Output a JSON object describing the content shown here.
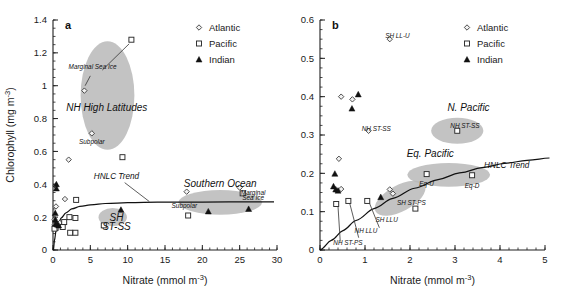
{
  "figure": {
    "panels": [
      "a",
      "b"
    ],
    "legend_entries": [
      {
        "label": "Atlantic",
        "marker": "open-diamond"
      },
      {
        "label": "Pacific",
        "marker": "open-square"
      },
      {
        "label": "Indian",
        "marker": "filled-triangle"
      }
    ],
    "blob_color": "#b8b8b8",
    "line_color": "#111111"
  },
  "chart_data": [
    {
      "type": "scatter",
      "panel": "a",
      "title": "a",
      "xlabel": "Nitrate (mmol m-3)",
      "xlabel_rich": "Nitrate (mmol m⁻³)",
      "ylabel": "Chlorophyll (mg m-3)",
      "ylabel_rich": "Chlorophyll (mg m⁻³)",
      "xlim": [
        0,
        30
      ],
      "ylim": [
        0,
        1.4
      ],
      "xticks": [
        "0",
        "5",
        "10",
        "15",
        "20",
        "25",
        "30"
      ],
      "xtick_values": [
        0,
        5,
        10,
        15,
        20,
        25,
        30
      ],
      "yticks": [
        "0",
        "0.2",
        "0.4",
        "0.6",
        "0.8",
        "1",
        "1.2",
        "1.4"
      ],
      "ytick_values": [
        0,
        0.2,
        0.4,
        0.6,
        0.8,
        1.0,
        1.2,
        1.4
      ],
      "xminor_step": 1,
      "yminor_step": 0.05,
      "grid": false,
      "legend_position": "top-right",
      "series": [
        {
          "name": "Atlantic",
          "marker": "open-diamond",
          "points": [
            [
              4.2,
              0.97
            ],
            [
              5.2,
              0.71
            ],
            [
              2.1,
              0.55
            ],
            [
              1.6,
              0.31
            ],
            [
              0.35,
              0.39
            ],
            [
              0.4,
              0.265
            ],
            [
              0.2,
              0.185
            ],
            [
              0.25,
              0.155
            ],
            [
              0.9,
              0.165
            ],
            [
              17.9,
              0.355
            ],
            [
              25.0,
              0.38
            ]
          ]
        },
        {
          "name": "Pacific",
          "marker": "open-square",
          "points": [
            [
              10.5,
              1.28
            ],
            [
              9.3,
              0.565
            ],
            [
              3.1,
              0.305
            ],
            [
              2.2,
              0.2
            ],
            [
              3.0,
              0.195
            ],
            [
              2.3,
              0.105
            ],
            [
              3.0,
              0.105
            ],
            [
              0.35,
              0.135
            ],
            [
              0.2,
              0.13
            ],
            [
              1.3,
              0.14
            ],
            [
              1.5,
              0.17
            ],
            [
              6.8,
              0.15
            ],
            [
              18.1,
              0.21
            ],
            [
              25.4,
              0.345
            ]
          ]
        },
        {
          "name": "Indian",
          "marker": "filled-triangle",
          "points": [
            [
              0.45,
              0.4
            ],
            [
              0.45,
              0.375
            ],
            [
              0.3,
              0.225
            ],
            [
              0.3,
              0.185
            ],
            [
              0.35,
              0.16
            ],
            [
              0.55,
              0.155
            ],
            [
              0.75,
              0.15
            ],
            [
              9.1,
              0.245
            ],
            [
              20.8,
              0.235
            ],
            [
              26.2,
              0.25
            ]
          ]
        }
      ],
      "trend": {
        "name": "HNLC Trend",
        "description": "saturating curve rising steeply from origin to ~0.29 plateau",
        "points": [
          [
            0.05,
            0.0
          ],
          [
            0.2,
            0.06
          ],
          [
            0.4,
            0.115
          ],
          [
            0.7,
            0.16
          ],
          [
            1.1,
            0.195
          ],
          [
            1.7,
            0.225
          ],
          [
            2.5,
            0.25
          ],
          [
            3.6,
            0.265
          ],
          [
            5,
            0.275
          ],
          [
            7,
            0.283
          ],
          [
            10,
            0.288
          ],
          [
            14,
            0.291
          ],
          [
            20,
            0.292
          ],
          [
            26,
            0.293
          ],
          [
            29.6,
            0.293
          ]
        ]
      },
      "blobs": [
        {
          "label": "NH High Latitudes",
          "cx": 7.3,
          "cy": 0.94,
          "rx": 3.6,
          "ry": 0.33,
          "label_dx": 0,
          "label_dy": -0.105
        },
        {
          "label": "SH ST-SS",
          "cx": 8.0,
          "cy": 0.2,
          "rx": 1.9,
          "ry": 0.055
        },
        {
          "label": "Southern Ocean",
          "cx": 22.4,
          "cy": 0.29,
          "rx": 5.6,
          "ry": 0.075
        }
      ],
      "annotations": [
        {
          "text": "Marginal Sea Ice",
          "x": 5.3,
          "y": 1.1,
          "style": "small-italic"
        },
        {
          "text": "NH High Latitudes",
          "x": 7.2,
          "y": 0.845,
          "style": "large-italic"
        },
        {
          "text": "Subpolar",
          "x": 5.2,
          "y": 0.645,
          "style": "small-italic"
        },
        {
          "text": "HNLC Trend",
          "x": 8.5,
          "y": 0.435,
          "style": "mid-italic"
        },
        {
          "text": "Southern Ocean",
          "x": 22.4,
          "y": 0.385,
          "style": "large-italic"
        },
        {
          "text": "Marginal",
          "x": 26.8,
          "y": 0.335,
          "style": "small-italic"
        },
        {
          "text": "Sea Ice",
          "x": 26.8,
          "y": 0.305,
          "style": "small-italic"
        },
        {
          "text": "Subpolar",
          "x": 17.6,
          "y": 0.255,
          "style": "small-italic"
        },
        {
          "text": "SH",
          "x": 8.5,
          "y": 0.175,
          "style": "large-italic"
        },
        {
          "text": "ST-SS",
          "x": 8.5,
          "y": 0.12,
          "style": "large-italic"
        }
      ]
    },
    {
      "type": "scatter",
      "panel": "b",
      "title": "b",
      "xlabel": "Nitrate (mmol m-3)",
      "xlabel_rich": "Nitrate (mmol m⁻³)",
      "ylabel": "",
      "xlim": [
        0,
        5
      ],
      "ylim": [
        0,
        0.6
      ],
      "xticks": [
        "0",
        "1",
        "2",
        "3",
        "4",
        "5"
      ],
      "xtick_values": [
        0,
        1,
        2,
        3,
        4,
        5
      ],
      "yticks": [
        "0",
        "0.1",
        "0.2",
        "0.3",
        "0.4",
        "0.5",
        "0.6"
      ],
      "ytick_values": [
        0,
        0.1,
        0.2,
        0.3,
        0.4,
        0.5,
        0.6
      ],
      "xminor_step": 0.2,
      "yminor_step": 0.025,
      "grid": false,
      "legend_position": "top-right",
      "series": [
        {
          "name": "Atlantic",
          "marker": "open-diamond",
          "points": [
            [
              1.55,
              0.55
            ],
            [
              0.47,
              0.4
            ],
            [
              0.72,
              0.393
            ],
            [
              1.08,
              0.311
            ],
            [
              0.42,
              0.238
            ],
            [
              0.47,
              0.159
            ],
            [
              1.55,
              0.158
            ],
            [
              1.62,
              0.147
            ]
          ]
        },
        {
          "name": "Pacific",
          "marker": "open-square",
          "points": [
            [
              3.05,
              0.311
            ],
            [
              2.37,
              0.198
            ],
            [
              3.38,
              0.195
            ],
            [
              1.05,
              0.128
            ],
            [
              0.63,
              0.128
            ],
            [
              0.36,
              0.12
            ],
            [
              2.12,
              0.108
            ]
          ]
        },
        {
          "name": "Indian",
          "marker": "filled-triangle",
          "points": [
            [
              0.85,
              0.406
            ],
            [
              0.71,
              0.369
            ],
            [
              0.33,
              0.199
            ],
            [
              0.3,
              0.166
            ],
            [
              0.35,
              0.158
            ],
            [
              0.4,
              0.155
            ],
            [
              1.35,
              0.138
            ]
          ]
        }
      ],
      "trend": {
        "name": "HNLC Trend",
        "description": "concave rising curve from origin toward ~0.24 at x=5",
        "points": [
          [
            0,
            0
          ],
          [
            0.25,
            0.025
          ],
          [
            0.5,
            0.05
          ],
          [
            0.8,
            0.077
          ],
          [
            1.2,
            0.108
          ],
          [
            1.6,
            0.134
          ],
          [
            2.1,
            0.161
          ],
          [
            2.6,
            0.183
          ],
          [
            3.1,
            0.201
          ],
          [
            3.6,
            0.215
          ],
          [
            4.1,
            0.226
          ],
          [
            4.6,
            0.234
          ],
          [
            5.1,
            0.24
          ]
        ]
      },
      "blobs": [
        {
          "label": "N. Pacific",
          "cx": 3.05,
          "cy": 0.311,
          "rx": 0.58,
          "ry": 0.034
        },
        {
          "label": "Eq. Pacific",
          "cx": 2.86,
          "cy": 0.196,
          "rx": 0.92,
          "ry": 0.031
        },
        {
          "label": "SH ST-PS",
          "cx": 1.78,
          "cy": 0.135,
          "rx": 0.62,
          "ry": 0.034,
          "rotate": -28
        }
      ],
      "annotations": [
        {
          "text": "SH LL-U",
          "x": 1.72,
          "y": 0.553,
          "style": "small-italic"
        },
        {
          "text": "N. Pacific",
          "x": 3.3,
          "y": 0.362,
          "style": "large-italic"
        },
        {
          "text": "NH ST-SS",
          "x": 3.22,
          "y": 0.318,
          "style": "small-italic"
        },
        {
          "text": "NH ST-SS",
          "x": 1.25,
          "y": 0.31,
          "style": "small-italic"
        },
        {
          "text": "Eq. Pacific",
          "x": 2.45,
          "y": 0.243,
          "style": "large-italic"
        },
        {
          "text": "HNLC Trend",
          "x": 4.15,
          "y": 0.215,
          "style": "mid-italic"
        },
        {
          "text": "Eq-U",
          "x": 2.37,
          "y": 0.166,
          "style": "small-italic"
        },
        {
          "text": "Eq-D",
          "x": 3.38,
          "y": 0.163,
          "style": "small-italic"
        },
        {
          "text": "SH ST-PS",
          "x": 2.03,
          "y": 0.118,
          "style": "small-italic"
        },
        {
          "text": "SH LLU",
          "x": 1.48,
          "y": 0.073,
          "style": "small-italic"
        },
        {
          "text": "NH LLU",
          "x": 1.02,
          "y": 0.045,
          "style": "small-italic"
        },
        {
          "text": "NH ST-PS",
          "x": 0.62,
          "y": 0.012,
          "style": "small-italic"
        }
      ]
    }
  ]
}
